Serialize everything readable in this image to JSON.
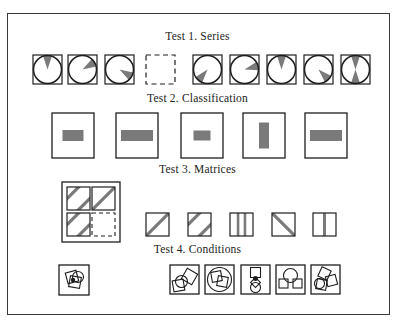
{
  "figure": {
    "tests": [
      {
        "id": "series",
        "title": "Test 1.  Series",
        "items": [
          {
            "kind": "wedge",
            "angles_deg": [
              0
            ]
          },
          {
            "kind": "wedge",
            "angles_deg": [
              60
            ]
          },
          {
            "kind": "wedge",
            "angles_deg": [
              120
            ]
          },
          {
            "kind": "blank"
          },
          {
            "kind": "wedge",
            "angles_deg": [
              220
            ]
          },
          {
            "kind": "wedge",
            "angles_deg": [
              75
            ]
          },
          {
            "kind": "wedge",
            "angles_deg": [
              0
            ]
          },
          {
            "kind": "wedge",
            "angles_deg": [
              135
            ]
          },
          {
            "kind": "wedge",
            "angles_deg": [
              0,
              180
            ]
          }
        ]
      },
      {
        "id": "classification",
        "title": "Test 2.  Classification",
        "items": [
          {
            "bar_shape": "horizontal-short"
          },
          {
            "bar_shape": "horizontal-long"
          },
          {
            "bar_shape": "horizontal-small"
          },
          {
            "bar_shape": "vertical"
          },
          {
            "bar_shape": "horizontal-long"
          }
        ]
      },
      {
        "id": "matrices",
        "title": "Test 3.  Matrices",
        "matrix": [
          {
            "pattern": "diag-two"
          },
          {
            "pattern": "diag-one"
          },
          {
            "pattern": "diag-two"
          },
          {
            "pattern": "blank"
          }
        ],
        "options": [
          {
            "pattern": "diag-one"
          },
          {
            "pattern": "diag-two"
          },
          {
            "pattern": "vertical-two"
          },
          {
            "pattern": "anti-diag-one"
          },
          {
            "pattern": "vertical-one"
          }
        ]
      },
      {
        "id": "conditions",
        "title": "Test 4.  Conditions",
        "example": {
          "shapes": "square-square-circle-with-dot"
        },
        "options": [
          {
            "shapes": "circle-two-squares"
          },
          {
            "shapes": "big-circle-two-squares"
          },
          {
            "shapes": "square-circle-dot-diamond"
          },
          {
            "shapes": "circle-two-squares-below"
          },
          {
            "shapes": "three-squares-circle"
          }
        ]
      }
    ],
    "colors": {
      "ink": "#1e1e1e",
      "fill": "#7a7a7a"
    }
  }
}
